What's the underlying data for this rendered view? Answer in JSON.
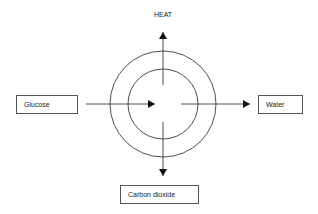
{
  "diagram": {
    "center_label": "",
    "top_label": "HEAT",
    "left_box": "Glucose",
    "right_box": "Water",
    "bottom_box": "Carbon dioxide",
    "colors": {
      "line": "#222222",
      "box_border": "#555555",
      "text": "#222222"
    }
  }
}
